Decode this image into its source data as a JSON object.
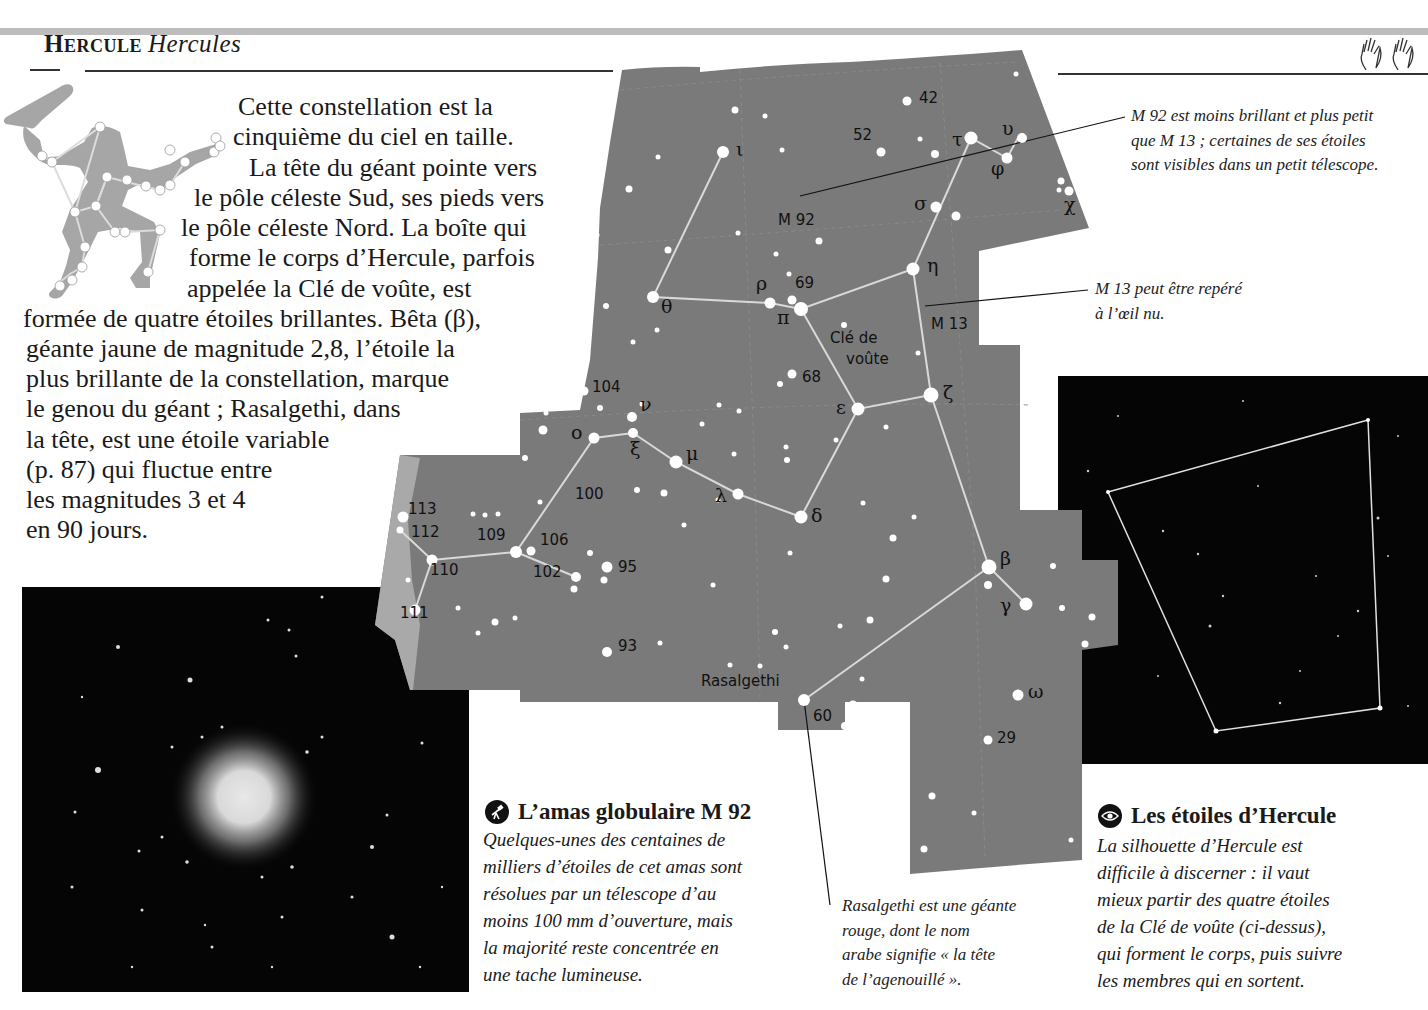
{
  "header": {
    "title_fr": "Hercule",
    "title_latin": "Hercules",
    "hands_icon": "hands-icon"
  },
  "intro": {
    "lines": [
      "Cette constellation est la",
      "cinquième du ciel en taille.",
      "La tête du géant pointe vers",
      "le pôle céleste Sud, ses pieds vers",
      "le pôle céleste Nord. La boîte qui",
      "forme le corps d’Hercule, parfois",
      "appelée la Clé de voûte, est",
      "formée de quatre étoiles brillantes. Bêta (β),",
      "géante jaune de magnitude 2,8, l’étoile la",
      "plus brillante de la constellation, marque",
      "le genou du géant ; Rasalgethi, dans",
      "la tête, est une étoile variable",
      "(p. 87) qui fluctue entre",
      "les magnitudes 3 et 4",
      "en 90 jours."
    ]
  },
  "map": {
    "fill_color": "#7a7a7a",
    "light_region_color": "#a9a9a9",
    "line_color": "#d9d9d9",
    "labels": {
      "n42": "42",
      "n52": "52",
      "m92": "M 92",
      "n69": "69",
      "m13": "M 13",
      "cle1": "Clé de",
      "cle2": "voûte",
      "n68": "68",
      "n104": "104",
      "n100": "100",
      "n113": "113",
      "n112": "112",
      "n109": "109",
      "n106": "106",
      "n110": "110",
      "n102": "102",
      "n95": "95",
      "n111": "111",
      "n93": "93",
      "rasalgethi": "Rasalgethi",
      "n60": "60",
      "n29": "29"
    },
    "greek": {
      "iota": "ι",
      "tau": "τ",
      "upsilon": "υ",
      "phi": "φ",
      "chi": "χ",
      "sigma": "σ",
      "eta": "η",
      "rho": "ρ",
      "pi": "π",
      "theta": "θ",
      "zeta": "ζ",
      "epsilon": "ε",
      "nu": "ν",
      "omicron": "ο",
      "xi": "ξ",
      "mu": "μ",
      "lambda": "λ",
      "delta": "δ",
      "beta": "β",
      "gamma": "γ",
      "omega": "ω"
    }
  },
  "callouts": {
    "m92": [
      "M 92 est moins brillant et plus petit",
      "que M 13 ; certaines de ses étoiles",
      "sont visibles dans un petit télescope."
    ],
    "m13": [
      "M 13 peut être repéré",
      "à l’œil nu."
    ],
    "rasalgethi": [
      "Rasalgethi est une géante",
      "rouge, dont le nom",
      "arabe signifie « la tête",
      "de l’agenouillé »."
    ]
  },
  "boxes": {
    "m92_box": {
      "icon": "telescope-icon",
      "title": "L’amas globulaire M 92",
      "lines": [
        "Quelques-unes des centaines de",
        "milliers d’étoiles de cet amas sont",
        "résolues par un télescope d’au",
        "moins 100 mm d’ouverture, mais",
        "la majorité reste concentrée en",
        "une tache lumineuse."
      ]
    },
    "stars_box": {
      "icon": "eye-icon",
      "title": "Les étoiles d’Hercule",
      "lines": [
        "La silhouette d’Hercule est",
        "difficile à discerner : il vaut",
        "mieux partir des quatre étoiles",
        "de la Clé de voûte (ci-dessus),",
        "qui forment le corps, puis suivre",
        "les membres qui en sortent."
      ]
    }
  }
}
